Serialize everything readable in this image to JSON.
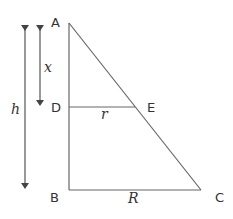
{
  "diagram": {
    "type": "similar-triangles",
    "colors": {
      "stroke": "#555555",
      "text": "#333333",
      "background": "#ffffff"
    },
    "points": {
      "A": {
        "label": "A",
        "x": 69,
        "y": 23
      },
      "B": {
        "label": "B",
        "x": 69,
        "y": 190
      },
      "C": {
        "label": "C",
        "x": 201,
        "y": 190
      },
      "D": {
        "label": "D",
        "x": 69,
        "y": 107
      },
      "E": {
        "label": "E",
        "x": 135,
        "y": 107
      }
    },
    "segments": [
      "AB",
      "BC",
      "CA",
      "DE"
    ],
    "dimensions": {
      "h": {
        "label": "h",
        "from": "A",
        "to": "B"
      },
      "x": {
        "label": "x",
        "from": "A",
        "to": "D"
      },
      "r": {
        "label": "r",
        "segment": "DE"
      },
      "R": {
        "label": "R",
        "segment": "BC"
      }
    }
  }
}
